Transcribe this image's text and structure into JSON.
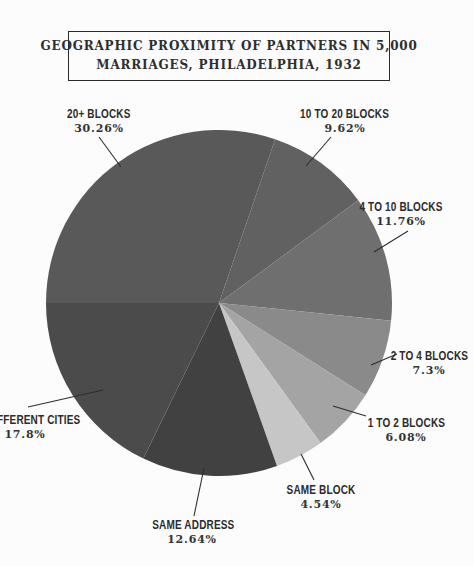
{
  "title": {
    "line1": "GEOGRAPHIC PROXIMITY OF PARTNERS IN 5,000",
    "line2": "MARRIAGES, PHILADELPHIA, 1932"
  },
  "chart_data": {
    "type": "pie",
    "title": "GEOGRAPHIC PROXIMITY OF PARTNERS IN 5,000 MARRIAGES, PHILADELPHIA, 1932",
    "start_angle_deg": 270,
    "direction": "clockwise",
    "legend": "none",
    "slices": [
      {
        "label": "20+ BLOCKS",
        "value": 30.26,
        "pct_label": "30.26%",
        "color": "#595959"
      },
      {
        "label": "10 TO 20 BLOCKS",
        "value": 9.62,
        "pct_label": "9.62%",
        "color": "#616161"
      },
      {
        "label": "4 TO 10 BLOCKS",
        "value": 11.76,
        "pct_label": "11.76%",
        "color": "#6f6f6f"
      },
      {
        "label": "2 TO 4 BLOCKS",
        "value": 7.3,
        "pct_label": "7.3%",
        "color": "#8a8a8a"
      },
      {
        "label": "1 TO 2 BLOCKS",
        "value": 6.08,
        "pct_label": "6.08%",
        "color": "#a4a4a4"
      },
      {
        "label": "SAME BLOCK",
        "value": 4.54,
        "pct_label": "4.54%",
        "color": "#c6c6c6"
      },
      {
        "label": "SAME ADDRESS",
        "value": 12.64,
        "pct_label": "12.64%",
        "color": "#414141"
      },
      {
        "label": "DIFFERENT CITIES",
        "value": 17.8,
        "pct_label": "17.8%",
        "color": "#4b4b4b"
      }
    ]
  }
}
